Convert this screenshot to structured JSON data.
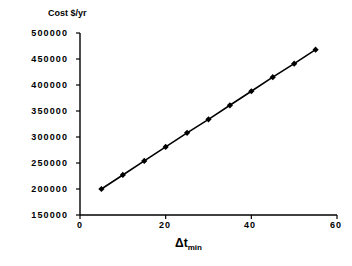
{
  "chart_data": {
    "type": "line",
    "title": "",
    "ylabel": "Cost $/yr",
    "xlabel": "Δt",
    "xlabel_sub": "min",
    "x": [
      5,
      10,
      15,
      20,
      25,
      30,
      35,
      40,
      45,
      50,
      55
    ],
    "values": [
      200000,
      227000,
      254000,
      281000,
      308000,
      334000,
      361000,
      388000,
      415000,
      441000,
      468000
    ],
    "series": [
      {
        "name": "Cost $/yr",
        "values": [
          200000,
          227000,
          254000,
          281000,
          308000,
          334000,
          361000,
          388000,
          415000,
          441000,
          468000
        ]
      }
    ],
    "xlim": [
      0,
      60
    ],
    "ylim": [
      150000,
      500000
    ],
    "xticks": [
      "0",
      "20",
      "40",
      "60"
    ],
    "xtick_values": [
      0,
      20,
      40,
      60
    ],
    "yticks": [
      "150000",
      "200000",
      "250000",
      "300000",
      "350000",
      "400000",
      "450000",
      "500000"
    ],
    "ytick_values": [
      150000,
      200000,
      250000,
      300000,
      350000,
      400000,
      450000,
      500000
    ],
    "grid": false,
    "legend": false,
    "legend_position": "none",
    "marker": "diamond",
    "line_color": "#000000",
    "marker_color": "#000000",
    "axis_color": "#000000",
    "background_color": "#ffffff"
  }
}
